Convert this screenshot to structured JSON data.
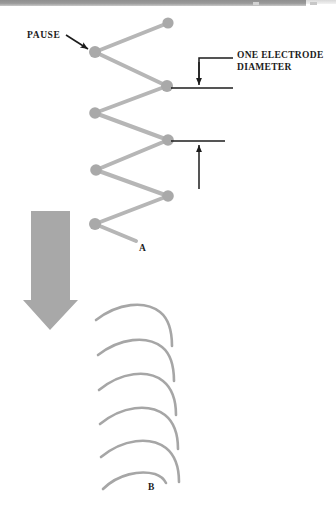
{
  "figure": {
    "colors": {
      "node": "#a9a9a9",
      "path": "#b6b6b6",
      "arc": "#a6a6a6",
      "block_arrow": "#a8a8a8",
      "annotation": "#1c1c1c",
      "scan_bar": "#8f8f8f",
      "background": "#ffffff"
    }
  },
  "annotations": {
    "pause_label": "PAUSE",
    "electrode_diameter_label_line1": "ONE ELECTRODE",
    "electrode_diameter_label_line2": "DIAMETER",
    "panel_a_label": "A",
    "panel_b_label": "B"
  },
  "panel_a": {
    "name": "zigzag-weave-pattern",
    "description": "Zigzag electrode travel path with pause dots at each direction change",
    "node_count": 8,
    "nodes": [
      {
        "index": 1,
        "x": 168,
        "y": 23,
        "side": "right"
      },
      {
        "index": 2,
        "x": 95,
        "y": 52,
        "side": "left"
      },
      {
        "index": 3,
        "x": 167,
        "y": 86,
        "side": "right"
      },
      {
        "index": 4,
        "x": 95,
        "y": 113,
        "side": "left"
      },
      {
        "index": 5,
        "x": 168,
        "y": 140,
        "side": "right"
      },
      {
        "index": 6,
        "x": 96,
        "y": 170,
        "side": "left"
      },
      {
        "index": 7,
        "x": 168,
        "y": 196,
        "side": "right"
      },
      {
        "index": 8,
        "x": 95,
        "y": 224,
        "side": "left"
      }
    ],
    "tail": {
      "from_x": 95,
      "from_y": 224,
      "to_x": 136,
      "to_y": 241
    },
    "node_radius": 5.5,
    "stroke_width": 4
  },
  "panel_b": {
    "name": "crescent-weave-pattern",
    "description": "Series of overlapping crescent arc weave beads progressing downward",
    "arc_count": 6,
    "arcs": [
      {
        "index": 1,
        "start_x": 96,
        "start_y": 320,
        "peak_x": 150,
        "peak_y": 305,
        "end_x": 172,
        "end_y": 345,
        "truncated": false
      },
      {
        "index": 2,
        "start_x": 98,
        "start_y": 355,
        "peak_x": 152,
        "peak_y": 340,
        "end_x": 174,
        "end_y": 380,
        "truncated": false
      },
      {
        "index": 3,
        "start_x": 99,
        "start_y": 390,
        "peak_x": 154,
        "peak_y": 374,
        "end_x": 176,
        "end_y": 414,
        "truncated": false
      },
      {
        "index": 4,
        "start_x": 100,
        "start_y": 424,
        "peak_x": 155,
        "peak_y": 408,
        "end_x": 178,
        "end_y": 448,
        "truncated": false
      },
      {
        "index": 5,
        "start_x": 101,
        "start_y": 457,
        "peak_x": 156,
        "peak_y": 441,
        "end_x": 179,
        "end_y": 481,
        "truncated": false
      },
      {
        "index": 6,
        "start_x": 103,
        "start_y": 488,
        "peak_x": 150,
        "peak_y": 477,
        "end_x": 166,
        "end_y": 484,
        "truncated": true
      }
    ],
    "stroke_width": 2.6
  },
  "callouts": {
    "pause_pointer": {
      "from_x": 66,
      "from_y": 35,
      "to_x": 89,
      "to_y": 50
    },
    "dimension_one": {
      "name": "one-electrode-diameter-dimension",
      "base_line_y": 88,
      "base_line_from_x": 172,
      "base_line_to_x": 233,
      "leader_top_y": 58,
      "leader_x": 199,
      "leader_to_x": 233,
      "arrow_direction": "down",
      "arrow_tip_y": 86
    },
    "dimension_two": {
      "name": "weave-spacing-dimension",
      "base_line_y": 141,
      "base_line_from_x": 172,
      "base_line_to_x": 225,
      "arrow_direction": "up",
      "arrow_x": 199,
      "arrow_tail_y": 189,
      "arrow_tip_y": 144
    }
  },
  "transition_arrow": {
    "name": "downward-transition-arrow",
    "shaft_left_x": 31,
    "shaft_right_x": 70,
    "top_y": 211,
    "shaft_bottom_y": 300,
    "head_left_x": 23,
    "head_right_x": 78,
    "tip_x": 50,
    "tip_y": 330
  }
}
